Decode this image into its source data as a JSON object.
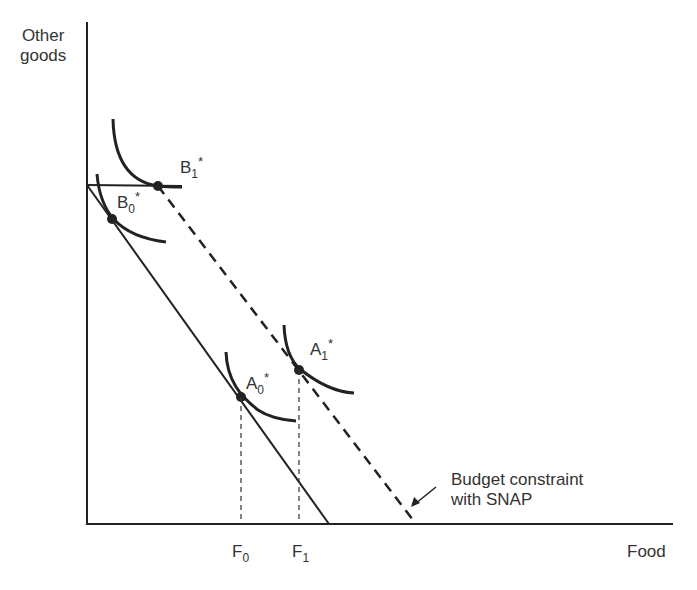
{
  "diagram": {
    "type": "indifference-curve budget constraint diagram",
    "axes": {
      "y_label_line1": "Other",
      "y_label_line2": "goods",
      "x_label": "Food"
    },
    "points": {
      "B1": {
        "base": "B",
        "sub": "1",
        "sup": "*"
      },
      "B0": {
        "base": "B",
        "sub": "0",
        "sup": "*"
      },
      "A1": {
        "base": "A",
        "sub": "1",
        "sup": "*"
      },
      "A0": {
        "base": "A",
        "sub": "0",
        "sup": "*"
      }
    },
    "ticks": {
      "F0": {
        "base": "F",
        "sub": "0"
      },
      "F1": {
        "base": "F",
        "sub": "1"
      }
    },
    "annotation": {
      "line1": "Budget constraint",
      "line2": "with SNAP"
    },
    "colors": {
      "ink": "#222222",
      "background": "#ffffff"
    }
  }
}
